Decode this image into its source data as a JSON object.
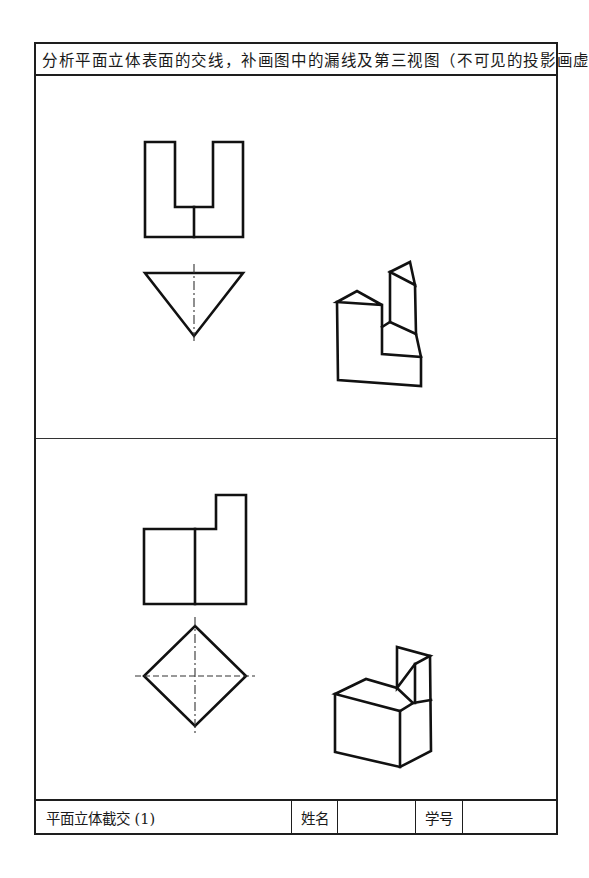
{
  "worksheet": {
    "title": "分析平面立体表面的交线，补画图中的漏线及第三视图（不可见的投影画虚线）",
    "problems": [
      {
        "id": 1,
        "views": [
          "front-view",
          "top-view",
          "isometric-view"
        ],
        "front_view_shape": "U-shaped block with slot",
        "top_view_shape": "inverted triangle with vertical center line",
        "isometric_shape": "triangular prism with stepped cut"
      },
      {
        "id": 2,
        "views": [
          "front-view",
          "top-view",
          "isometric-view"
        ],
        "front_view_shape": "stepped L-profile with vertical dividing line",
        "top_view_shape": "diamond (square rotated 45°) with dashed center lines",
        "isometric_shape": "square prism with stepped corner cut"
      }
    ]
  },
  "footer": {
    "exercise_name": "平面立体截交 (1)",
    "name_label": "姓名",
    "name_value": "",
    "student_id_label": "学号",
    "student_id_value": ""
  },
  "colors": {
    "line": "#111111",
    "background": "#ffffff"
  }
}
